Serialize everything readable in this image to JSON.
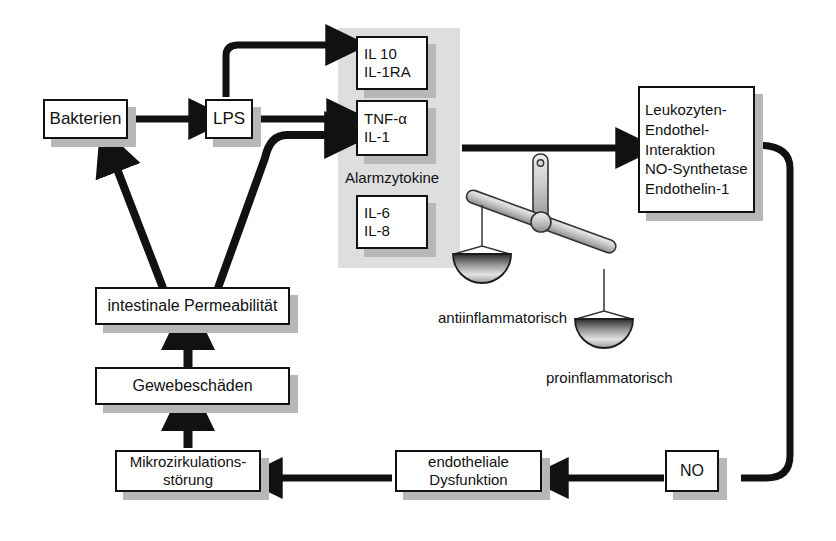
{
  "diagram": {
    "language": "de",
    "colors": {
      "line": "#111111",
      "box_border": "#111111",
      "box_fill": "#ffffff",
      "shadow": "#b7b7b7",
      "panel_fill": "#dedede",
      "scale_fill": "#c9c9c9"
    }
  },
  "nodes": {
    "bakterien": {
      "label": "Bakterien"
    },
    "lps": {
      "label": "LPS"
    },
    "antiinflam_cytokines": {
      "line1": "IL 10",
      "line2": "IL-1RA"
    },
    "alarm_cytokines": {
      "line1": "TNF-α",
      "line2": "IL-1"
    },
    "il68": {
      "line1": "IL-6",
      "line2": "IL-8"
    },
    "endothel": {
      "line1": "Leukozyten-",
      "line2": "Endothel-",
      "line3": "Interaktion",
      "line4": "NO-Synthetase",
      "line5": "Endothelin-1"
    },
    "intestinale_permeabilitaet": {
      "label": "intestinale Permeabilität"
    },
    "gewebeschaeden": {
      "label": "Gewebeschäden"
    },
    "mikrozirkulation": {
      "line1": "Mikrozirkulations-",
      "line2": "störung"
    },
    "endotheliale_dysfunktion": {
      "line1": "endotheliale",
      "line2": "Dysfunktion"
    },
    "no": {
      "label": "NO"
    }
  },
  "captions": {
    "alarmzytokine": "Alarmzytokine",
    "antiinflammatorisch": "antiinflammatorisch",
    "proinflammatorisch": "proinflammatorisch"
  }
}
